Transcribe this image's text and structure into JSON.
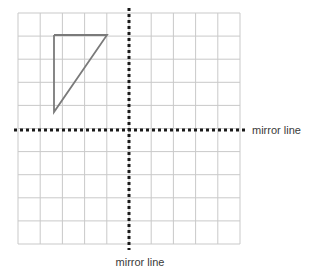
{
  "figure": {
    "background_color": "#ffffff"
  },
  "grid": {
    "color": "#c9c9c9",
    "line_width": 1,
    "columns": 10,
    "rows": 10,
    "cell_width": 22.2,
    "cell_height": 23.1,
    "left": 18,
    "top": 13,
    "right": 240,
    "bottom": 244
  },
  "mirror_lines": [
    {
      "id": "vertical-mirror-line",
      "orientation": "vertical",
      "x": 129,
      "y_start": 8,
      "y_end": 250,
      "color": "#1a1a1a",
      "dash": "3 3",
      "width": 3,
      "label": "mirror line"
    },
    {
      "id": "horizontal-mirror-line",
      "orientation": "horizontal",
      "y": 130,
      "x_start": 14,
      "x_end": 248,
      "color": "#1a1a1a",
      "dash": "3 3",
      "width": 3,
      "label": "mirror line"
    }
  ],
  "labels": {
    "right_label": "mirror line",
    "bottom_label": "mirror line",
    "right_label_x": 252,
    "right_label_y": 134,
    "bottom_label_x": 140,
    "bottom_label_y": 266
  },
  "shape": {
    "name": "right-triangle",
    "stroke_color": "#7a7a7a",
    "stroke_width": 1.8,
    "fill": "none",
    "vertices_px": [
      {
        "label": "top-left",
        "x": 54,
        "y": 35
      },
      {
        "label": "top-right",
        "x": 107,
        "y": 35
      },
      {
        "label": "bottom-left",
        "x": 54,
        "y": 112
      }
    ],
    "vertices_grid": [
      {
        "label": "top-left",
        "x": -3.4,
        "y": 4.1
      },
      {
        "label": "top-right",
        "x": -1.0,
        "y": 4.1
      },
      {
        "label": "bottom-left",
        "x": -3.4,
        "y": 0.8
      }
    ]
  }
}
